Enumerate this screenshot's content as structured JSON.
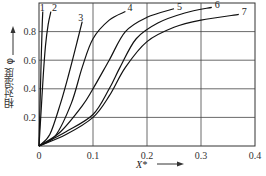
{
  "chart_data": {
    "type": "line",
    "title": "",
    "xlabel": "X*",
    "ylabel": "相对湿度 φ",
    "xlim": [
      0,
      0.4
    ],
    "ylim": [
      0,
      1.0
    ],
    "x_ticks": [
      "0",
      "0.1",
      "0.2",
      "0.3",
      "0.4"
    ],
    "y_ticks": [
      "0.2",
      "0.4",
      "0.6",
      "0.8"
    ],
    "grid": true,
    "legend": "curve numbers labeled at curve ends",
    "series": [
      {
        "name": "1",
        "x": [
          0,
          0.002,
          0.004,
          0.006,
          0.007
        ],
        "y": [
          0,
          0.3,
          0.6,
          0.85,
          0.94
        ]
      },
      {
        "name": "2",
        "x": [
          0,
          0.004,
          0.008,
          0.012,
          0.017,
          0.022
        ],
        "y": [
          0,
          0.25,
          0.5,
          0.7,
          0.85,
          0.94
        ]
      },
      {
        "name": "3",
        "x": [
          0,
          0.02,
          0.04,
          0.055,
          0.07,
          0.08
        ],
        "y": [
          0,
          0.08,
          0.3,
          0.5,
          0.72,
          0.87
        ]
      },
      {
        "name": "4",
        "x": [
          0,
          0.03,
          0.06,
          0.08,
          0.1,
          0.13,
          0.16
        ],
        "y": [
          0,
          0.07,
          0.3,
          0.55,
          0.75,
          0.88,
          0.94
        ]
      },
      {
        "name": "5",
        "x": [
          0,
          0.04,
          0.08,
          0.1,
          0.13,
          0.16,
          0.2,
          0.25
        ],
        "y": [
          0,
          0.1,
          0.28,
          0.4,
          0.6,
          0.8,
          0.9,
          0.96
        ]
      },
      {
        "name": "6",
        "x": [
          0,
          0.05,
          0.1,
          0.13,
          0.15,
          0.18,
          0.22,
          0.27,
          0.32
        ],
        "y": [
          0,
          0.1,
          0.22,
          0.4,
          0.55,
          0.75,
          0.86,
          0.93,
          0.97
        ]
      },
      {
        "name": "7",
        "x": [
          0,
          0.05,
          0.1,
          0.13,
          0.16,
          0.2,
          0.25,
          0.3,
          0.37
        ],
        "y": [
          0,
          0.08,
          0.2,
          0.35,
          0.55,
          0.73,
          0.83,
          0.88,
          0.92
        ]
      }
    ]
  },
  "axes": {
    "xlabel": "X*",
    "ylabel": "相对湿度 φ",
    "x_tick_labels": [
      "0",
      "0.1",
      "0.2",
      "0.3",
      "0.4"
    ],
    "y_tick_labels": [
      "0.2",
      "0.4",
      "0.6",
      "0.8"
    ]
  },
  "curve_labels": [
    "1",
    "2",
    "3",
    "4",
    "5",
    "6",
    "7"
  ]
}
